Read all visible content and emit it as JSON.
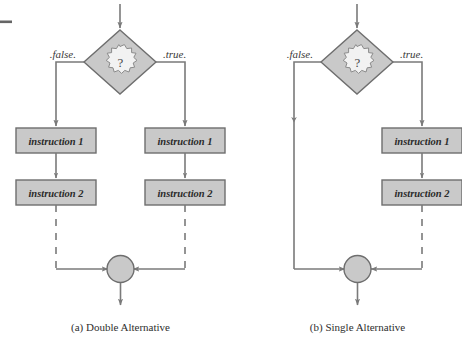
{
  "figure": {
    "background_color": "#ffffff",
    "scan_artifact": {
      "name": "page-edge-mark",
      "color": "#4a4a4a"
    }
  },
  "style": {
    "shape_fill": "#c9c9c9",
    "shape_stroke": "#6e6e6e",
    "line_color": "#7a7a7a",
    "text_color": "#2b2b2b",
    "cloud_fill": "#f2f2f2"
  },
  "diagrams": [
    {
      "id": "double-alternative",
      "caption": "(a) Double Alternative",
      "decision": {
        "name": "decision-diamond",
        "symbol": "?",
        "shape": "diamond-with-cloud"
      },
      "branches": [
        {
          "label": ".false.",
          "side": "left",
          "instructions": [
            "instruction 1",
            "instruction 2"
          ]
        },
        {
          "label": ".true.",
          "side": "right",
          "instructions": [
            "instruction 1",
            "instruction 2"
          ]
        }
      ],
      "merge": {
        "name": "merge-circle",
        "shape": "circle"
      }
    },
    {
      "id": "single-alternative",
      "caption": "(b) Single Alternative",
      "decision": {
        "name": "decision-diamond",
        "symbol": "?",
        "shape": "diamond-with-cloud"
      },
      "branches": [
        {
          "label": ".false.",
          "side": "left",
          "instructions": []
        },
        {
          "label": ".true.",
          "side": "right",
          "instructions": [
            "instruction 1",
            "instruction 2"
          ]
        }
      ],
      "merge": {
        "name": "merge-circle",
        "shape": "circle"
      }
    }
  ]
}
